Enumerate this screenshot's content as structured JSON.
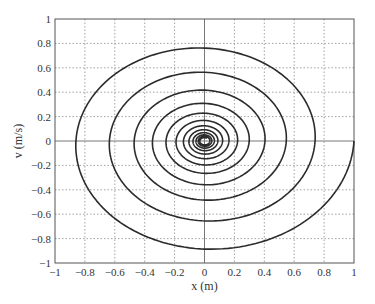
{
  "chart_data": {
    "type": "line",
    "title": "",
    "xlabel": "x (m)",
    "ylabel": "v (m/s)",
    "xlim": [
      -1,
      1
    ],
    "ylim": [
      -1,
      1
    ],
    "grid": true,
    "legend": null,
    "x_ticks": [
      -1,
      -0.8,
      -0.6,
      -0.4,
      -0.2,
      0,
      0.2,
      0.4,
      0.6,
      0.8,
      1
    ],
    "x_tick_labels": [
      "−1",
      "−0.8",
      "−0.6",
      "−0.4",
      "−0.2",
      "0",
      "0.2",
      "0.4",
      "0.6",
      "0.8",
      "1"
    ],
    "y_ticks": [
      -1,
      -0.8,
      -0.6,
      -0.4,
      -0.2,
      0,
      0.2,
      0.4,
      0.6,
      0.8,
      1
    ],
    "y_tick_labels": [
      "−1",
      "−0.8",
      "−0.6",
      "−0.4",
      "−0.2",
      "0",
      "0.2",
      "0.4",
      "0.6",
      "0.8",
      "1"
    ],
    "series": [
      {
        "name": "phase trajectory",
        "description": "Damped oscillator phase portrait: clockwise inward spiral starting at (1, 0)",
        "start": [
          1.0,
          0.0
        ],
        "decay_per_half_cycle": 0.86,
        "x_axis_crossings_right": [
          1.0,
          0.73,
          0.54,
          0.4,
          0.29,
          0.21,
          0.14,
          0.1,
          0.06
        ],
        "x_axis_crossings_left": [
          -0.86,
          -0.64,
          -0.47,
          -0.35,
          -0.25,
          -0.19,
          -0.13,
          -0.1,
          -0.07,
          -0.05
        ],
        "v_axis_crossings_top": [
          0.845,
          0.64,
          0.48,
          0.35,
          0.26,
          0.19
        ],
        "v_axis_crossings_bottom": [
          -0.955,
          -0.72,
          -0.56,
          -0.41,
          -0.315,
          -0.24
        ],
        "color": "#2b2b2b"
      }
    ]
  },
  "colors": {
    "curve": "#2b2b2b",
    "grid": "#8a8a8a",
    "axis": "#777777",
    "frame": "#555555",
    "text": "#333333"
  }
}
